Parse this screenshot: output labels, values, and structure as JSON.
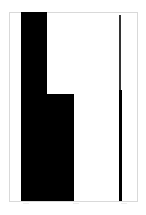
{
  "chart_data": {
    "type": "bar",
    "title": "",
    "xlabel": "",
    "ylabel": "",
    "grid": false,
    "legend": null,
    "ylim": [
      0,
      1
    ],
    "colors": {
      "bar": "#000000",
      "line": "#1a1a1a",
      "frame": "#d9d9d9",
      "background": "#ffffff"
    },
    "categories": [
      "bar-1",
      "bar-2"
    ],
    "values": [
      1.0,
      0.57
    ],
    "series": [
      {
        "name": "bars",
        "values": [
          1.0,
          0.57
        ]
      },
      {
        "name": "vertical-line",
        "segments": [
          {
            "from": 0.0,
            "to": 0.59,
            "width": "thick"
          },
          {
            "from": 0.59,
            "to": 0.98,
            "width": "thin"
          }
        ]
      }
    ],
    "layout": {
      "frame": {
        "x": 9,
        "y": 12,
        "width": 128,
        "height": 189
      },
      "bars": [
        {
          "x": 21,
          "width": 26,
          "top": 12
        },
        {
          "x": 47,
          "width": 27,
          "top": 94
        }
      ],
      "line": {
        "x": 119,
        "thin_top": 15,
        "thick_top": 90,
        "bottom": 201
      }
    }
  }
}
